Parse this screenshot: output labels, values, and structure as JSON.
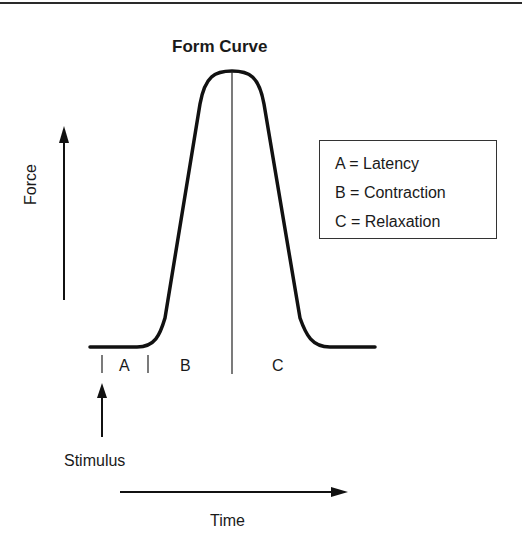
{
  "figure": {
    "title": "Form Curve",
    "y_axis_label": "Force",
    "x_axis_label": "Time",
    "stimulus_label": "Stimulus",
    "segments": [
      "A",
      "B",
      "C"
    ],
    "legend": [
      {
        "key": "A",
        "text": "A = Latency"
      },
      {
        "key": "B",
        "text": "B = Contraction"
      },
      {
        "key": "C",
        "text": "C = Relaxation"
      }
    ]
  },
  "colors": {
    "line": "#111111",
    "background": "#ffffff"
  }
}
